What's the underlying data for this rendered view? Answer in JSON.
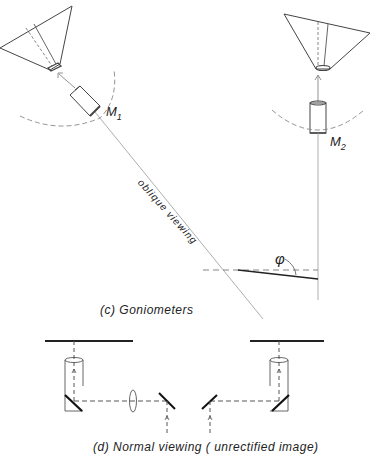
{
  "diagram": {
    "panel_c": {
      "caption": "(c)  Goniometers",
      "labels": {
        "m1_main": "M",
        "m1_sub": "1",
        "m2_main": "M",
        "m2_sub": "2",
        "oblique": "oblique viewing",
        "angle": "φ"
      }
    },
    "panel_d": {
      "caption": "(d)  Normal  viewing ( unrectified image)"
    },
    "colors": {
      "line": "#333333",
      "light_line": "#999999",
      "dash": "#777777"
    }
  }
}
